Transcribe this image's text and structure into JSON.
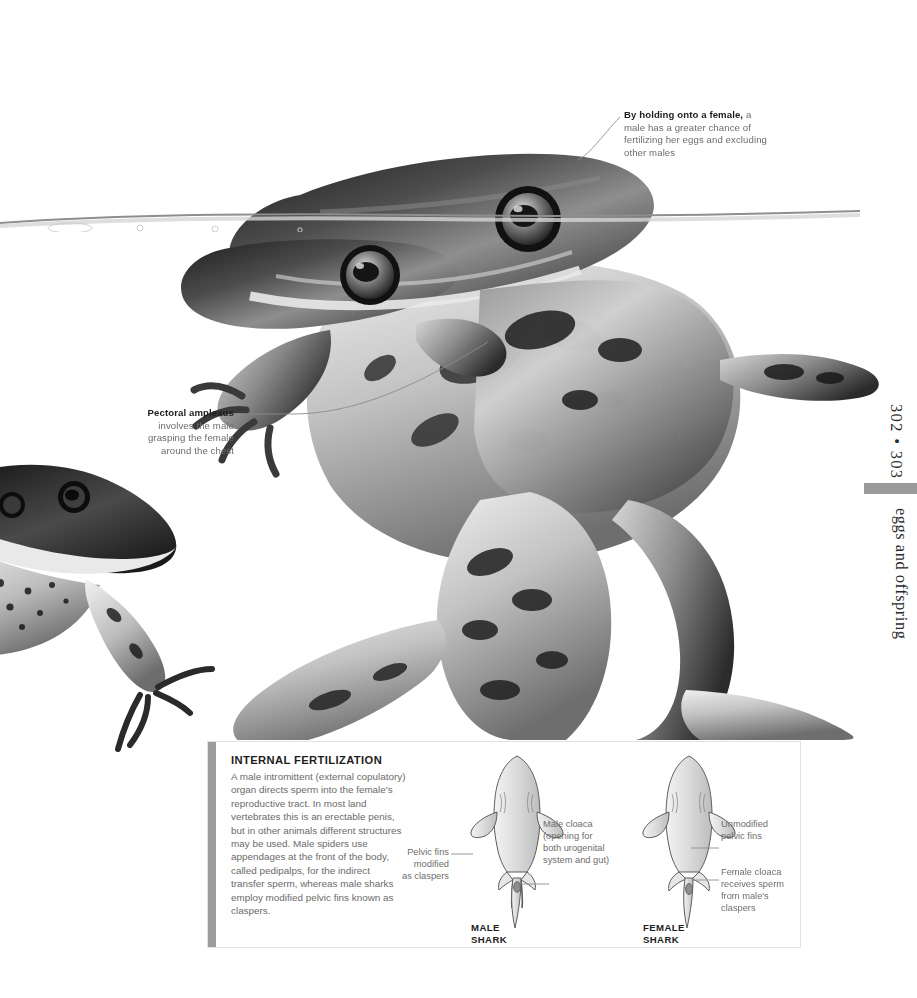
{
  "page": {
    "folio_numbers": "302 • 303",
    "chapter_title": "eggs and offspring",
    "accent_color": "#9a9a9a"
  },
  "photo": {
    "caption_alt": "Two frogs in amplexus at the water surface, black and white photograph",
    "second_frog_alt": "A third frog approaching from the left"
  },
  "annotations": [
    {
      "id": "amplexus-holding",
      "heading": "By holding onto a female,",
      "body": "a male has a greater chance of fertilizing her eggs and excluding other males"
    },
    {
      "id": "pectoral-amplexus",
      "heading": "Pectoral amplexus",
      "body": "involves the male grasping the female around the chest"
    }
  ],
  "panel": {
    "title": "INTERNAL FERTILIZATION",
    "body": "A male intromittent (external copulatory) organ directs sperm into the female's reproductive tract. In most land vertebrates this is an erectable penis, but in other animals different structures may be used. Male spiders use appendages at the front of the body, called pedipalps, for the indirect transfer sperm, whereas male sharks employ modified pelvic fins known as claspers.",
    "diagram": {
      "male_shark_caption": "MALE\nSHARK",
      "female_shark_caption": "FEMALE\nSHARK",
      "labels": [
        {
          "id": "pelvic-fins-claspers",
          "text": "Pelvic fins\nmodified\nas claspers"
        },
        {
          "id": "male-cloaca",
          "text": "Male cloaca\n(opening for\nboth urogenital\nsystem and gut)"
        },
        {
          "id": "unmodified-pelvic-fins",
          "text": "Unmodified\npelvic fins"
        },
        {
          "id": "female-cloaca",
          "text": "Female cloaca\nreceives sperm\nfrom male's\nclaspers"
        }
      ]
    }
  }
}
